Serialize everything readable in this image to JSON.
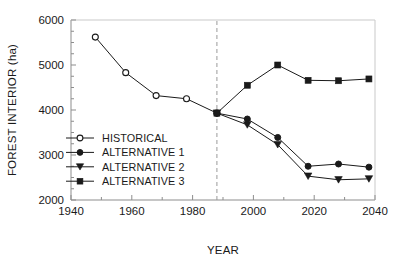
{
  "chart_data": {
    "type": "line",
    "title": "",
    "xlabel": "YEAR",
    "ylabel": "FOREST INTERIOR (ha)",
    "xlim": [
      1940,
      2040
    ],
    "ylim": [
      2000,
      6000
    ],
    "xticks": [
      1940,
      1960,
      1980,
      2000,
      2020,
      2040
    ],
    "xticklabels": [
      "1940",
      "1960",
      "1980",
      "2000",
      "2020",
      "2040"
    ],
    "xminorticks": [
      1950,
      1970,
      1990,
      2010,
      2030
    ],
    "yticks": [
      2000,
      3000,
      4000,
      5000,
      6000
    ],
    "yticklabels": [
      "2000",
      "3000",
      "4000",
      "5000",
      "6000"
    ],
    "yminorticks": [
      2250,
      2500,
      2750,
      3250,
      3500,
      3750,
      4250,
      4500,
      4750,
      5250,
      5500,
      5750
    ],
    "grid": false,
    "legend_position": "center-left",
    "annotations": [
      {
        "type": "vline",
        "x": 1988,
        "style": "dashed",
        "color": "#9a9a9a"
      }
    ],
    "series": [
      {
        "name": "HISTORICAL",
        "marker": "open-circle",
        "color": "#1a1a1a",
        "x": [
          1948,
          1958,
          1968,
          1978,
          1988
        ],
        "values": [
          5620,
          4830,
          4320,
          4250,
          3930
        ]
      },
      {
        "name": "ALTERNATIVE 1",
        "marker": "filled-circle",
        "color": "#1a1a1a",
        "x": [
          1988,
          1998,
          2008,
          2018,
          2028,
          2038
        ],
        "values": [
          3930,
          3800,
          3390,
          2750,
          2800,
          2730
        ]
      },
      {
        "name": "ALTERNATIVE 2",
        "marker": "filled-triangle-down",
        "color": "#1a1a1a",
        "x": [
          1988,
          1998,
          2008,
          2018,
          2028,
          2038
        ],
        "values": [
          3930,
          3670,
          3230,
          2530,
          2450,
          2470
        ]
      },
      {
        "name": "ALTERNATIVE 3",
        "marker": "filled-square",
        "color": "#1a1a1a",
        "x": [
          1988,
          1998,
          2008,
          2018,
          2028,
          2038
        ],
        "values": [
          3930,
          4550,
          5000,
          4660,
          4650,
          4690
        ]
      }
    ]
  },
  "legend": {
    "entries": [
      {
        "label": "HISTORICAL",
        "marker": "open-circle"
      },
      {
        "label": "ALTERNATIVE 1",
        "marker": "filled-circle"
      },
      {
        "label": "ALTERNATIVE 2",
        "marker": "filled-triangle-down"
      },
      {
        "label": "ALTERNATIVE 3",
        "marker": "filled-square"
      }
    ]
  }
}
